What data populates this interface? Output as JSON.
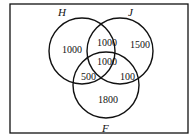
{
  "diagram": {
    "type": "venn",
    "sets": [
      {
        "name": "H",
        "label": "H"
      },
      {
        "name": "J",
        "label": "J"
      },
      {
        "name": "F",
        "label": "F"
      }
    ],
    "regions": {
      "H_only": "1000",
      "J_only": "1500",
      "F_only": "1800",
      "H_and_J_only": "1000",
      "H_and_F_only": "500",
      "J_and_F_only": "100",
      "H_and_J_and_F": "1000"
    }
  }
}
